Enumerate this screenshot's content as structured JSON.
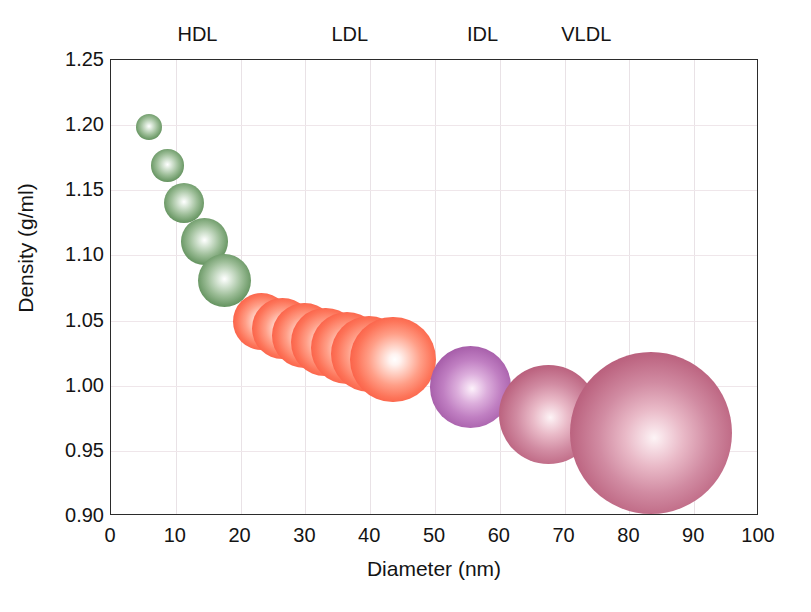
{
  "chart_data": {
    "type": "scatter",
    "title": "",
    "xlabel": "Diameter (nm)",
    "ylabel": "Density (g/ml)",
    "xlim": [
      0,
      100
    ],
    "ylim": [
      0.9,
      1.25
    ],
    "grid": true,
    "legend_position": "top-inside-above-axis",
    "xticks": [
      "0",
      "10",
      "20",
      "30",
      "40",
      "50",
      "60",
      "70",
      "80",
      "90",
      "100"
    ],
    "yticks": [
      "0.90",
      "0.95",
      "1.00",
      "1.05",
      "1.10",
      "1.15",
      "1.20",
      "1.25"
    ],
    "class_labels": [
      {
        "name": "HDL",
        "x": 13.5,
        "color": "#5c8a57"
      },
      {
        "name": "LDL",
        "x": 37.0,
        "color": "#fa553d"
      },
      {
        "name": "IDL",
        "x": 57.5,
        "color": "#a85aac"
      },
      {
        "name": "VLDL",
        "x": 73.5,
        "color": "#bb6480"
      }
    ],
    "series": [
      {
        "name": "HDL",
        "color": "#5c8a57",
        "points": [
          {
            "x": 5.9,
            "y": 1.1985,
            "r_nm": 2.0
          },
          {
            "x": 8.7,
            "y": 1.169,
            "r_nm": 2.5
          },
          {
            "x": 11.3,
            "y": 1.14,
            "r_nm": 3.1
          },
          {
            "x": 14.4,
            "y": 1.1105,
            "r_nm": 3.6
          },
          {
            "x": 17.5,
            "y": 1.0805,
            "r_nm": 4.1
          }
        ]
      },
      {
        "name": "LDL",
        "color": "#fa553d",
        "points": [
          {
            "x": 23.3,
            "y": 1.049,
            "r_nm": 4.4
          },
          {
            "x": 26.5,
            "y": 1.044,
            "r_nm": 4.7
          },
          {
            "x": 29.8,
            "y": 1.0385,
            "r_nm": 5.0
          },
          {
            "x": 33.1,
            "y": 1.0335,
            "r_nm": 5.3
          },
          {
            "x": 36.4,
            "y": 1.029,
            "r_nm": 5.6
          },
          {
            "x": 39.8,
            "y": 1.0245,
            "r_nm": 5.9
          },
          {
            "x": 43.5,
            "y": 1.02,
            "r_nm": 6.6
          }
        ]
      },
      {
        "name": "IDL",
        "color": "#a85aac",
        "points": [
          {
            "x": 55.5,
            "y": 0.999,
            "r_nm": 6.3
          }
        ]
      },
      {
        "name": "VLDL",
        "color": "#bb6480",
        "points": [
          {
            "x": 67.5,
            "y": 0.978,
            "r_nm": 7.6
          },
          {
            "x": 83.3,
            "y": 0.964,
            "r_nm": 12.5
          }
        ]
      }
    ]
  }
}
